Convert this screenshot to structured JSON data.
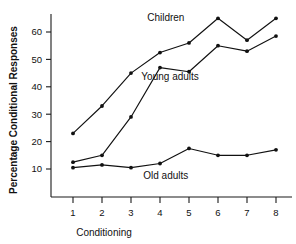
{
  "chart_data": {
    "type": "line",
    "title": "",
    "xlabel": "Conditioning",
    "ylabel": "Percentage Conditional Responses",
    "x": [
      1,
      2,
      3,
      4,
      5,
      6,
      7,
      8
    ],
    "categories": [
      "1",
      "2",
      "3",
      "4",
      "5",
      "6",
      "7",
      "8"
    ],
    "xlim": [
      0.6,
      8.4
    ],
    "ylim": [
      0,
      68
    ],
    "yticks": [
      10,
      20,
      30,
      40,
      50,
      60
    ],
    "ytick_labels": [
      "10",
      "20",
      "30",
      "40",
      "50",
      "60"
    ],
    "xticks": [
      1,
      2,
      3,
      4,
      5,
      6,
      7,
      8
    ],
    "grid": false,
    "legend": "inline-annotations",
    "marker": "filled-circle",
    "line_color": "#111111",
    "series": [
      {
        "name": "Children",
        "label": "Children",
        "values": [
          23,
          33,
          45,
          52.5,
          56,
          65,
          57,
          65
        ],
        "label_x": 4.2,
        "label_y": 64
      },
      {
        "name": "Young adults",
        "label": "Young adults",
        "values": [
          12.5,
          15,
          29,
          47,
          45.5,
          55,
          53,
          58.5
        ],
        "label_x": 4.35,
        "label_y": 42.5
      },
      {
        "name": "Old adults",
        "label": "Old adults",
        "values": [
          10.5,
          11.5,
          10.5,
          12,
          17.5,
          15,
          15,
          17
        ],
        "label_x": 4.2,
        "label_y": 6.5
      }
    ]
  }
}
